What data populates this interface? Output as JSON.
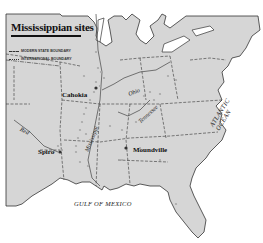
{
  "legend": {
    "title": "Mississippian sites",
    "items": [
      {
        "label": "MODERN STATE BOUNDARY",
        "style": "dashed"
      },
      {
        "label": "INTERNATIONAL BOUNDARY",
        "style": "dash-dot"
      }
    ]
  },
  "sites": [
    {
      "name": "Cahokia"
    },
    {
      "name": "Spiro"
    },
    {
      "name": "Moundville"
    }
  ],
  "rivers": [
    {
      "name": "Red"
    },
    {
      "name": "Mississippi"
    },
    {
      "name": "Ohio"
    },
    {
      "name": "Tennessee"
    }
  ],
  "water_bodies": [
    {
      "name": "GULF OF MEXICO"
    },
    {
      "name": "ATLANTIC OCEAN"
    }
  ],
  "colors": {
    "land": "#d6d6d6",
    "water": "#ffffff",
    "boundary": "#333333",
    "site_dot": "#a8a8a8"
  }
}
